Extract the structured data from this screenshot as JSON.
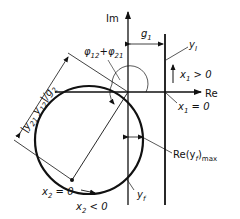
{
  "diagram": {
    "axes": {
      "imaginary_label": "Im",
      "real_label": "Re"
    },
    "labels": {
      "g1": "g",
      "g1_sub": "1",
      "yI": "y",
      "yI_sub": "I",
      "x1_pos": "x",
      "x1_pos_sub": "1",
      "x1_pos_rel": " > 0",
      "x1_zero": "x",
      "x1_zero_sub": "1",
      "x1_zero_rel": " = 0",
      "phase": "φ",
      "phase_sub1": "12",
      "phase_plus": "+",
      "phase2": "φ",
      "phase_sub2": "21",
      "diameter": "|y",
      "diameter_sub1": "21",
      "diameter_mid": " y",
      "diameter_sub2": "12",
      "diameter_end": "|/g",
      "diameter_sub3": "2",
      "re_max": "Re(y",
      "re_max_sub": "f",
      "re_max_end": ")",
      "re_max_sub2": "max",
      "yf": "y",
      "yf_sub": "f",
      "x2_zero": "x",
      "x2_zero_sub": "2",
      "x2_zero_rel": " = 0",
      "x2_neg": "x",
      "x2_neg_sub": "2",
      "x2_neg_rel": " < 0"
    },
    "colors": {
      "ink": "#111111",
      "background": "#ffffff"
    }
  }
}
